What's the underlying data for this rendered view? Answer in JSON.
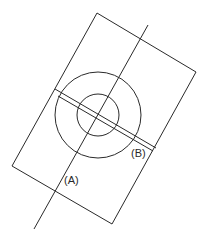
{
  "diagram": {
    "stroke_color": "#2a2a2a",
    "background": "#ffffff",
    "rectangle": {
      "points": "97,13 196,72 112,224 12,166"
    },
    "axis_line": {
      "x1": 148,
      "y1": 25,
      "x2": 34,
      "y2": 229
    },
    "outer_circle": {
      "cx": 98,
      "cy": 115,
      "r": 43
    },
    "inner_circle": {
      "cx": 98,
      "cy": 115,
      "r": 21
    },
    "band": {
      "line1": {
        "x1": 55,
        "y1": 89,
        "x2": 156,
        "y2": 148
      },
      "line2": {
        "x1": 58,
        "y1": 96,
        "x2": 153,
        "y2": 151
      },
      "center_line": {
        "x1": 61,
        "y1": 102,
        "x2": 138,
        "y2": 143
      }
    },
    "labels": {
      "a": {
        "text": "(A)",
        "x": 64,
        "y": 184
      },
      "b": {
        "text": "(B)",
        "x": 131,
        "y": 157
      }
    }
  }
}
